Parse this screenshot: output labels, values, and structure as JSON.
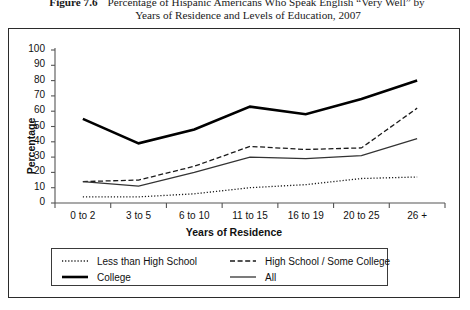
{
  "caption": {
    "figure_number": "Figure 7.6",
    "line1": "Percentage of Hispanic Americans Who Speak English “Very Well” by",
    "line2": "Years of Residence and Levels of Education, 2007"
  },
  "colors": {
    "ink": "#111111",
    "frame": "#2b2b2b",
    "axis": "#555555",
    "series_college": "#000000",
    "series_hs": "#1a1a1a",
    "series_all": "#333333",
    "series_lths": "#1a1a1a",
    "background": "#ffffff"
  },
  "legend": {
    "entries": [
      {
        "label": "Less than High School",
        "style": "dotted",
        "name": "legend-less-than-high-school"
      },
      {
        "label": "High School / Some College",
        "style": "dashed",
        "name": "legend-high-school-some-college"
      },
      {
        "label": "College",
        "style": "thick-solid",
        "name": "legend-college"
      },
      {
        "label": "All",
        "style": "thin-solid",
        "name": "legend-all"
      }
    ]
  },
  "chart_data": {
    "type": "line",
    "title": "Percentage of Hispanic Americans Who Speak English “Very Well” by Years of Residence and Levels of Education, 2007",
    "xlabel": "Years of Residence",
    "ylabel": "Percentage",
    "categories": [
      "0 to 2",
      "3 to 5",
      "6 to 10",
      "11 to 15",
      "16 to 19",
      "20 to 25",
      "26 +"
    ],
    "ylim": [
      0,
      100
    ],
    "yticks": [
      0,
      10,
      20,
      30,
      40,
      50,
      60,
      70,
      80,
      90,
      100
    ],
    "grid": false,
    "legend_position": "bottom",
    "series": [
      {
        "name": "Less than High School",
        "style": "dotted",
        "values": [
          4,
          4,
          6,
          10,
          12,
          16,
          17
        ]
      },
      {
        "name": "High School / Some College",
        "style": "dashed",
        "values": [
          14,
          15,
          24,
          37,
          35,
          36,
          62
        ]
      },
      {
        "name": "College",
        "style": "thick-solid",
        "values": [
          55,
          39,
          48,
          63,
          58,
          68,
          80
        ]
      },
      {
        "name": "All",
        "style": "thin-solid",
        "values": [
          14,
          11,
          20,
          30,
          29,
          31,
          42
        ]
      }
    ]
  }
}
